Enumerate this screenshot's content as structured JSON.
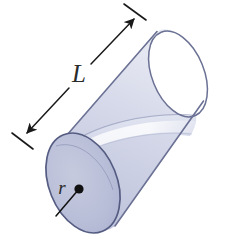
{
  "figure": {
    "shape": "cylinder",
    "background_color": "#ffffff"
  },
  "labels": {
    "length": "L",
    "radius": "r"
  },
  "annotations": {
    "length_dimension": {
      "name": "length-dimension-line",
      "label": "L",
      "style": "double-headed-arrow-with-end-ticks",
      "orientation": "diagonal-up-right"
    },
    "radius_dimension": {
      "name": "radius-leader-line",
      "label": "r",
      "style": "line-from-center-dot-to-edge",
      "orientation": "diagonal-down-left"
    }
  },
  "colors": {
    "outline": "#6b7194",
    "outline_dark": "#555c82",
    "near_cap_fill": "#b8bcd8",
    "body_fill": "#cdd1e4",
    "interior_fill": "#dfe2ef",
    "highlight": "#f2f3f9",
    "far_cap_fill": "#ffffff",
    "label_ink": "#2b2b2b",
    "arrow_ink": "#1a1a1a",
    "center_dot": "#111111"
  },
  "geometry": {
    "near_cap_center": {
      "x": 83,
      "y": 183
    },
    "near_cap_radius_x": 34,
    "near_cap_radius_y": 52,
    "near_cap_rotation_deg": -22,
    "far_cap_center": {
      "x": 178,
      "y": 74
    },
    "far_cap_radius_x": 26,
    "far_cap_radius_y": 45,
    "far_cap_rotation_deg": -22,
    "length_label_position": {
      "x": 79,
      "y": 76
    },
    "radius_label_position": {
      "x": 62,
      "y": 190
    },
    "center_dot_position": {
      "x": 79,
      "y": 189
    },
    "radius_endpoint": {
      "x": 56,
      "y": 216
    }
  }
}
